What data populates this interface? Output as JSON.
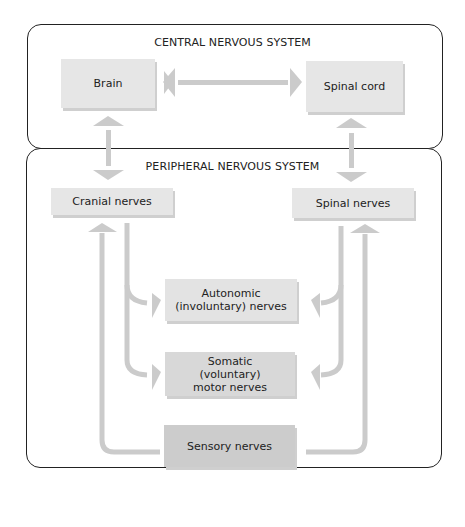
{
  "cns": {
    "title": "CENTRAL NERVOUS SYSTEM",
    "brain": "Brain",
    "spinal_cord": "Spinal cord"
  },
  "pns": {
    "title": "PERIPHERAL NERVOUS SYSTEM",
    "cranial": "Cranial nerves",
    "spinal": "Spinal nerves",
    "autonomic": "Autonomic (involuntary) nerves",
    "somatic": "Somatic (voluntary) motor nerves",
    "sensory": "Sensory nerves"
  },
  "colors": {
    "box_light": "#e6e6e6",
    "box_mid": "#d9d9d9",
    "box_dark": "#cccccc",
    "arrow": "#cbcbcb"
  }
}
